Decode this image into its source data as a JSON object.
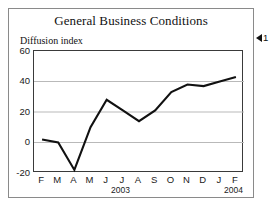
{
  "chart_data": {
    "type": "line",
    "title": "General Business Conditions",
    "ylabel": "Diffusion index",
    "xlabel": "",
    "ylim": [
      -20,
      60
    ],
    "yticks": [
      60,
      40,
      20,
      0,
      -20
    ],
    "ytick_labels": [
      "60",
      "40",
      "20",
      "0",
      "-20"
    ],
    "gridlines": [
      40,
      20,
      0
    ],
    "grid": true,
    "legend": "none",
    "categories": [
      "F",
      "M",
      "A",
      "M",
      "J",
      "J",
      "A",
      "S",
      "O",
      "N",
      "D",
      "J",
      "F"
    ],
    "values": [
      2,
      0,
      -18,
      10,
      28,
      21,
      14,
      21,
      33,
      38,
      37,
      40,
      43
    ],
    "period_labels": [
      {
        "text": "2003",
        "name": "year-2003"
      },
      {
        "text": "2004",
        "name": "year-2004"
      }
    ],
    "line_color": "#111111",
    "grid_color": "#b9b9b9",
    "axis_color": "#3a3a3a"
  },
  "annotation": {
    "marker": "left-triangle",
    "number": "1"
  }
}
